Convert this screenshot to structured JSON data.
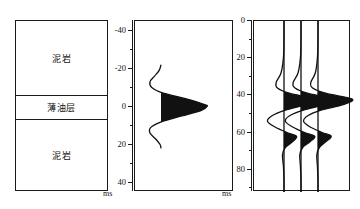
{
  "figure": {
    "type": "seismic-forward-model",
    "panels": [
      "lithology-column",
      "wavelet",
      "synthetic-traces"
    ]
  },
  "lithology": {
    "beds": [
      {
        "name": "upper-mudstone",
        "label": "泥岩"
      },
      {
        "name": "thin-oil-layer",
        "label": "薄油层"
      },
      {
        "name": "lower-mudstone",
        "label": "泥岩"
      }
    ]
  },
  "wavelet_panel": {
    "unit": "ms",
    "tick_labels": [
      "-40",
      "-20",
      "0",
      "20",
      "40"
    ]
  },
  "traces_panel": {
    "unit": "ms",
    "tick_labels": [
      "0",
      "20",
      "40",
      "60",
      "80"
    ]
  },
  "chart_data": [
    {
      "type": "line",
      "name": "wavelet",
      "title": "",
      "xlabel": "amplitude",
      "ylabel": "ms",
      "ylim": [
        -45,
        45
      ],
      "y_ticks_major": [
        -40,
        -20,
        0,
        20,
        40
      ],
      "y_ticks_minor": [
        -30,
        -10,
        10,
        30
      ],
      "grid": false,
      "legend": "none",
      "orientation": "vertical-time-axis",
      "fill_positive": true,
      "fill_color": "#111111",
      "x": [
        -22,
        -19,
        -16,
        -13,
        -10,
        -7,
        -4,
        -1,
        0,
        2,
        5,
        8,
        11,
        14,
        17,
        20,
        22
      ],
      "values": [
        0.0,
        -0.04,
        -0.14,
        -0.24,
        -0.2,
        0.05,
        0.55,
        0.95,
        1.0,
        0.88,
        0.45,
        0.02,
        -0.22,
        -0.24,
        -0.12,
        -0.02,
        0.0
      ]
    },
    {
      "type": "line",
      "name": "synthetic-traces",
      "title": "",
      "xlabel": "amplitude",
      "ylabel": "ms",
      "ylim": [
        0,
        92
      ],
      "y_ticks_major": [
        0,
        20,
        40,
        60,
        80
      ],
      "y_ticks_minor": [
        10,
        30,
        50,
        70,
        90
      ],
      "grid": false,
      "legend": "none",
      "orientation": "vertical-time-axis",
      "fill_positive": true,
      "fill_color": "#111111",
      "trace_count": 3,
      "series": [
        {
          "name": "trace-1",
          "baseline_ms_peak": 42,
          "x": [
            0,
            10,
            20,
            28,
            33,
            36,
            39,
            42,
            45,
            48,
            51,
            54,
            57,
            60,
            62,
            65,
            68,
            72,
            78,
            86,
            92
          ],
          "values": [
            0.0,
            0.0,
            -0.02,
            -0.1,
            -0.26,
            -0.22,
            0.2,
            1.0,
            0.72,
            0.05,
            -0.4,
            -0.55,
            -0.3,
            0.1,
            0.42,
            0.28,
            0.05,
            -0.05,
            -0.02,
            0.0,
            0.0
          ]
        },
        {
          "name": "trace-2",
          "baseline_ms_peak": 42,
          "x": [
            0,
            10,
            20,
            28,
            33,
            36,
            39,
            42,
            45,
            48,
            51,
            54,
            57,
            60,
            62,
            65,
            68,
            72,
            78,
            86,
            92
          ],
          "values": [
            0.0,
            0.0,
            -0.02,
            -0.1,
            -0.26,
            -0.2,
            0.24,
            1.06,
            0.78,
            0.08,
            -0.38,
            -0.52,
            -0.28,
            0.12,
            0.46,
            0.3,
            0.06,
            -0.04,
            -0.02,
            0.0,
            0.0
          ]
        },
        {
          "name": "trace-3",
          "baseline_ms_peak": 42,
          "x": [
            0,
            10,
            20,
            28,
            33,
            36,
            39,
            42,
            45,
            48,
            51,
            54,
            57,
            60,
            62,
            65,
            68,
            72,
            78,
            86,
            92
          ],
          "values": [
            0.0,
            0.0,
            -0.02,
            -0.09,
            -0.24,
            -0.18,
            0.28,
            1.14,
            0.84,
            0.1,
            -0.34,
            -0.48,
            -0.26,
            0.14,
            0.44,
            0.26,
            0.05,
            -0.04,
            -0.02,
            0.0,
            0.0
          ]
        }
      ]
    }
  ]
}
